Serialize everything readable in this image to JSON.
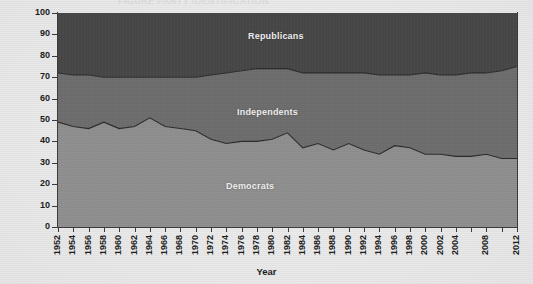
{
  "ghost_text": "FIGURE PARTY IDENTIFICATION",
  "chart_data": {
    "type": "area",
    "stacked": true,
    "title": "",
    "subtitle": "",
    "xlabel": "Year",
    "ylabel": "Percentage",
    "ylim": [
      0,
      100
    ],
    "ytick_values": [
      0,
      10,
      20,
      30,
      40,
      50,
      60,
      70,
      80,
      90,
      100
    ],
    "grid": false,
    "legend": "inline-labels",
    "x": [
      1952,
      1954,
      1956,
      1958,
      1960,
      1962,
      1964,
      1966,
      1968,
      1970,
      1972,
      1974,
      1976,
      1978,
      1980,
      1982,
      1984,
      1986,
      1988,
      1990,
      1992,
      1994,
      1996,
      1998,
      2000,
      2002,
      2004,
      2006,
      2008,
      2010,
      2012
    ],
    "xtick_labels": [
      "1952",
      "1954",
      "1956",
      "1958",
      "1960",
      "1962",
      "1964",
      "1966",
      "1968",
      "1970",
      "1972",
      "1974",
      "1976",
      "1978",
      "1980",
      "1982",
      "1984",
      "1986",
      "1988",
      "1990",
      "1992",
      "1994",
      "1996",
      "1998",
      "2000",
      "2002",
      "2004",
      "",
      "2008",
      "",
      "2012"
    ],
    "series": [
      {
        "name": "Democrats",
        "color": "#8f8f8f",
        "values": [
          49,
          47,
          46,
          49,
          46,
          47,
          51,
          47,
          46,
          45,
          41,
          39,
          40,
          40,
          41,
          44,
          37,
          39,
          36,
          39,
          36,
          34,
          38,
          37,
          34,
          34,
          33,
          33,
          34,
          32,
          32
        ]
      },
      {
        "name": "Independents",
        "color": "#6e6e6e",
        "values": [
          23,
          24,
          25,
          21,
          24,
          23,
          19,
          23,
          24,
          25,
          30,
          33,
          33,
          34,
          33,
          30,
          35,
          33,
          36,
          33,
          36,
          37,
          33,
          34,
          38,
          37,
          38,
          39,
          38,
          41,
          43
        ]
      },
      {
        "name": "Republicans",
        "color": "#474747",
        "values": [
          28,
          29,
          29,
          30,
          30,
          30,
          30,
          30,
          30,
          30,
          29,
          28,
          27,
          26,
          26,
          26,
          28,
          28,
          28,
          28,
          28,
          29,
          29,
          29,
          28,
          29,
          29,
          28,
          28,
          27,
          25
        ]
      }
    ],
    "boundary_top_democrats": [
      49,
      47,
      46,
      49,
      46,
      47,
      51,
      47,
      46,
      45,
      41,
      39,
      40,
      40,
      41,
      44,
      37,
      39,
      36,
      39,
      36,
      34,
      38,
      37,
      34,
      34,
      33,
      33,
      34,
      32,
      32
    ],
    "boundary_top_independents": [
      72,
      71,
      71,
      70,
      70,
      70,
      70,
      70,
      70,
      70,
      71,
      72,
      73,
      74,
      74,
      74,
      72,
      72,
      72,
      72,
      72,
      71,
      71,
      71,
      72,
      71,
      71,
      72,
      72,
      73,
      75
    ]
  },
  "series_labels": {
    "republicans": "Republicans",
    "independents": "Independents",
    "democrats": "Democrats"
  },
  "colors": {
    "republicans": "#474747",
    "independents": "#6e6e6e",
    "democrats": "#8f8f8f",
    "axis": "#3a3a3a",
    "boundary_stroke": "#2b2b2b",
    "text": "#1c1c1c",
    "background": "#e9e9e9"
  }
}
